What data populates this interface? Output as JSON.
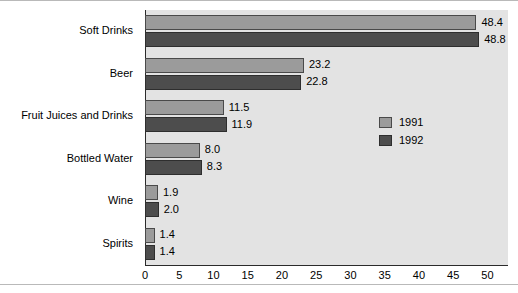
{
  "chart_data": {
    "type": "bar",
    "orientation": "horizontal",
    "title": "",
    "subtitle": "",
    "xlabel": "",
    "ylabel": "",
    "xlim": [
      0,
      53
    ],
    "xticks": [
      0,
      5,
      10,
      15,
      20,
      25,
      30,
      35,
      40,
      45,
      50
    ],
    "xtick_labels": [
      "0",
      "5",
      "10",
      "15",
      "20",
      "25",
      "30",
      "35",
      "40",
      "45",
      "50"
    ],
    "grid": false,
    "legend_position": "inside-right",
    "categories": [
      "Soft Drinks",
      "Beer",
      "Fruit Juices and Drinks",
      "Bottled Water",
      "Wine",
      "Spirits"
    ],
    "series": [
      {
        "name": "1991",
        "color": "#9b9b9b",
        "values": [
          48.4,
          23.2,
          11.5,
          8.0,
          1.9,
          1.4
        ],
        "labels": [
          "48.4",
          "23.2",
          "11.5",
          "8.0",
          "1.9",
          "1.4"
        ]
      },
      {
        "name": "1992",
        "color": "#4d4d4d",
        "values": [
          48.8,
          22.8,
          11.9,
          8.3,
          2.0,
          1.4
        ],
        "labels": [
          "48.8",
          "22.8",
          "11.9",
          "8.3",
          "2.0",
          "1.4"
        ]
      }
    ]
  },
  "legend": {
    "entries": [
      {
        "label": "1991",
        "color": "#9b9b9b"
      },
      {
        "label": "1992",
        "color": "#4d4d4d"
      }
    ]
  },
  "style": {
    "plot_background": "#e3e3e3",
    "page_background": "#ffffff",
    "axis_color": "#2b2b2b",
    "text_color": "#000000"
  }
}
